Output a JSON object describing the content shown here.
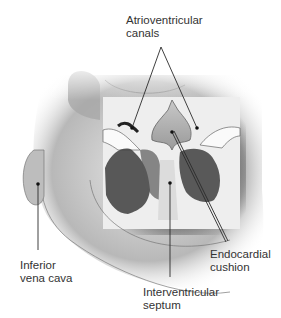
{
  "figure": {
    "colors": {
      "background": "#ffffff",
      "ink": "#333333",
      "leader": "#2a2a2a"
    }
  },
  "labels": {
    "av_canals": {
      "line1": "Atrioventricular",
      "line2": "canals"
    },
    "ivc": {
      "line1": "Inferior",
      "line2": "vena cava"
    },
    "cushion": {
      "line1": "Endocardial",
      "line2": "cushion"
    },
    "septum": {
      "line1": "Interventricular",
      "line2": "septum"
    }
  }
}
